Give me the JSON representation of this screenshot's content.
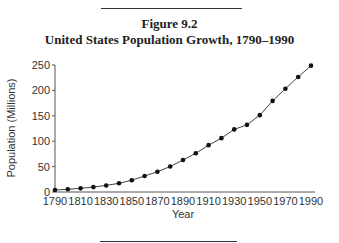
{
  "figure": {
    "number": "Figure 9.2",
    "title": "United States Population Growth, 1790–1990"
  },
  "chart_data": {
    "type": "line",
    "title": "United States Population Growth, 1790–1990",
    "xlabel": "Year",
    "ylabel": "Population (Millions)",
    "x": [
      1790,
      1800,
      1810,
      1820,
      1830,
      1840,
      1850,
      1860,
      1870,
      1880,
      1890,
      1900,
      1910,
      1920,
      1930,
      1940,
      1950,
      1960,
      1970,
      1980,
      1990
    ],
    "series": [
      {
        "name": "Population (Millions)",
        "values": [
          3.9,
          5.3,
          7.2,
          9.6,
          12.9,
          17.1,
          23.2,
          31.4,
          39.8,
          50.2,
          62.9,
          76.2,
          92.2,
          106.0,
          123.2,
          132.2,
          151.3,
          179.3,
          203.3,
          226.5,
          248.7
        ]
      }
    ],
    "xlim": [
      1790,
      1990
    ],
    "ylim": [
      0,
      250
    ],
    "x_ticks": [
      "1790",
      "1810",
      "1830",
      "1850",
      "1870",
      "1890",
      "1910",
      "1930",
      "1950",
      "1970",
      "1990"
    ],
    "y_ticks": [
      "0",
      "50",
      "100",
      "150",
      "200",
      "250"
    ],
    "grid": false,
    "legend": false,
    "marker": "filled-circle"
  }
}
